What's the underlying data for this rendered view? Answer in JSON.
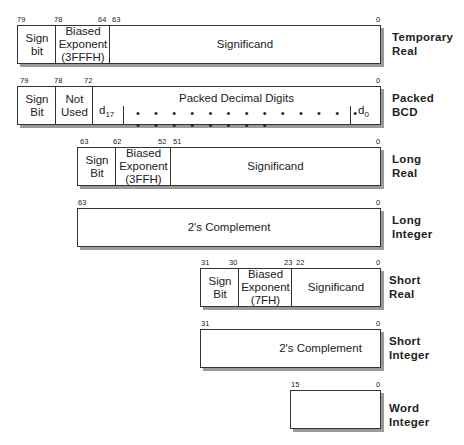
{
  "formats": [
    {
      "name": "Temporary Real",
      "label_line1": "Temporary",
      "label_line2": "Real",
      "bits": {
        "b79": "79",
        "b78": "78",
        "b64": "64",
        "b63": "63",
        "b0": "0"
      },
      "fields": [
        {
          "line1": "Sign",
          "line2": "bit"
        },
        {
          "line1": "Biased",
          "line2": "Exponent",
          "line3": "(3FFFH)"
        },
        {
          "line1": "Significand"
        }
      ]
    },
    {
      "name": "Packed BCD",
      "label_line1": "Packed",
      "label_line2": "BCD",
      "bits": {
        "b79": "79",
        "b78": "78",
        "b72": "72",
        "b0": "0"
      },
      "fields": [
        {
          "line1": "Sign",
          "line2": "Bit"
        },
        {
          "line1": "Not",
          "line2": "Used"
        },
        {
          "line1": "Packed Decimal Digits",
          "d_high": "d",
          "d_high_sub": "17",
          "d_low": "d",
          "d_low_sub": "0",
          "dots": "• • • • • • • • • • • • • • • • • • • • •"
        }
      ]
    },
    {
      "name": "Long Real",
      "label_line1": "Long",
      "label_line2": "Real",
      "bits": {
        "b63": "63",
        "b62": "62",
        "b52": "52",
        "b51": "51",
        "b0": "0"
      },
      "fields": [
        {
          "line1": "Sign",
          "line2": "Bit"
        },
        {
          "line1": "Biased",
          "line2": "Exponent",
          "line3": "(3FFH)"
        },
        {
          "line1": "Significand"
        }
      ]
    },
    {
      "name": "Long Integer",
      "label_line1": "Long",
      "label_line2": "Integer",
      "bits": {
        "b63": "63",
        "b0": "0"
      },
      "fields": [
        {
          "line1": "2's Complement"
        }
      ]
    },
    {
      "name": "Short Real",
      "label_line1": "Short",
      "label_line2": "Real",
      "bits": {
        "b31": "31",
        "b30": "30",
        "b23": "23",
        "b22": "22",
        "b0": "0"
      },
      "fields": [
        {
          "line1": "Sign",
          "line2": "Bit"
        },
        {
          "line1": "Biased",
          "line2": "Exponent",
          "line3": "(7FH)"
        },
        {
          "line1": "Significand"
        }
      ]
    },
    {
      "name": "Short Integer",
      "label_line1": "Short",
      "label_line2": "Integer",
      "bits": {
        "b31": "31",
        "b0": "0"
      },
      "fields": [
        {
          "line1": "2's Complement"
        }
      ]
    },
    {
      "name": "Word Integer",
      "label_line1": "Word",
      "label_line2": "Integer",
      "bits": {
        "b15": "15",
        "b0": "0"
      },
      "fields": []
    }
  ]
}
